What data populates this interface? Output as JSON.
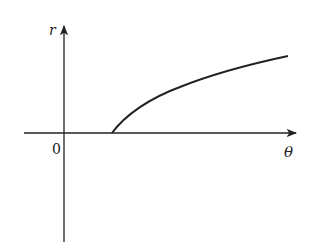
{
  "diagram": {
    "type": "polar-function-graph",
    "axes": {
      "vertical_label": "r",
      "horizontal_label": "θ",
      "origin_label": "0"
    },
    "curve": {
      "description": "increasing concave curve starting on the θ-axis to the right of the origin",
      "start_point_px": [
        112,
        133
      ],
      "end_point_px": [
        288,
        56
      ]
    },
    "colors": {
      "line": "#222222",
      "background": "#ffffff"
    }
  }
}
